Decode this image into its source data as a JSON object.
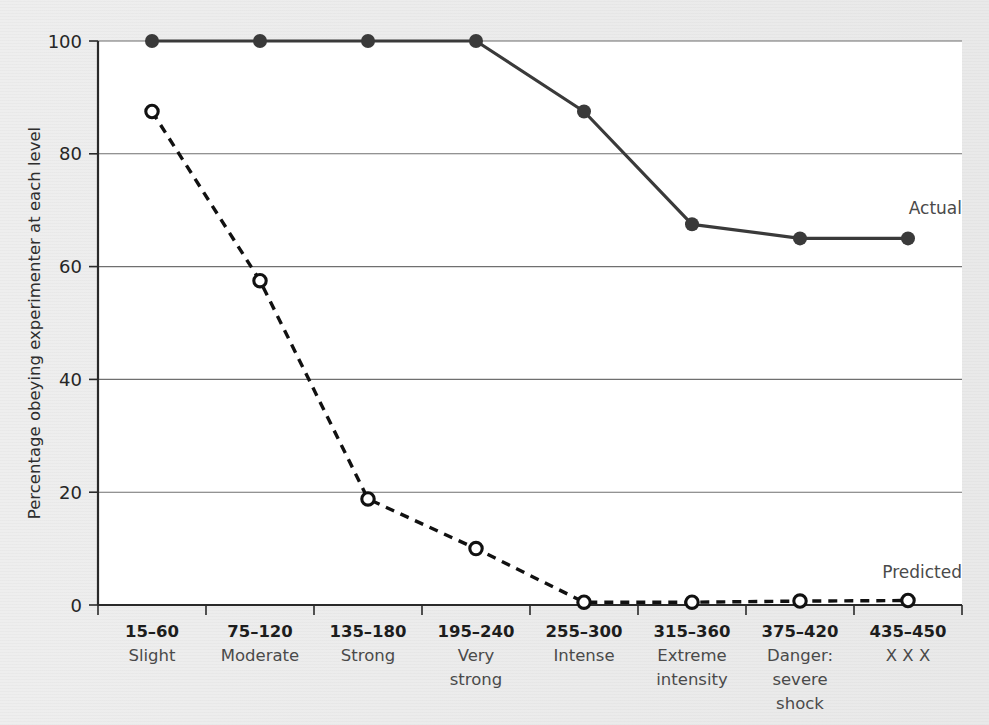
{
  "chart_data": {
    "type": "line",
    "title": "",
    "xlabel": "",
    "ylabel": "Percentage obeying experimenter at each level",
    "ylim": [
      0,
      100
    ],
    "yticks": [
      0,
      20,
      40,
      60,
      80,
      100
    ],
    "grid": "horizontal",
    "legend_position": "inline-right-of-series-end",
    "categories": [
      "15–60",
      "75–120",
      "135–180",
      "195–240",
      "255–300",
      "315–360",
      "375–420",
      "435–450"
    ],
    "category_descriptions": [
      "Slight",
      "Moderate",
      "Strong",
      "Very strong",
      "Intense",
      "Extreme intensity",
      "Danger: severe shock",
      "X X X"
    ],
    "category_descriptions_lines": [
      [
        "Slight"
      ],
      [
        "Moderate"
      ],
      [
        "Strong"
      ],
      [
        "Very",
        "strong"
      ],
      [
        "Intense"
      ],
      [
        "Extreme",
        "intensity"
      ],
      [
        "Danger:",
        "severe",
        "shock"
      ],
      [
        "X X X"
      ]
    ],
    "series": [
      {
        "name": "Actual",
        "marker": "filled-circle",
        "line_style": "solid",
        "color": "#3a3a3a",
        "values": [
          100,
          100,
          100,
          100,
          87.5,
          67.5,
          65,
          65
        ]
      },
      {
        "name": "Predicted",
        "marker": "open-circle",
        "line_style": "dashed",
        "color": "#111111",
        "values": [
          87.5,
          57.5,
          18.8,
          10,
          0.5,
          0.5,
          0.7,
          0.8
        ]
      }
    ],
    "annotations": [
      {
        "text": "Actual",
        "series": "Actual"
      },
      {
        "text": "Predicted",
        "series": "Predicted"
      }
    ]
  },
  "yaxis": {
    "label": "Percentage obeying experimenter at each level",
    "ticks": [
      "0",
      "20",
      "40",
      "60",
      "80",
      "100"
    ]
  },
  "legend": {
    "actual": "Actual",
    "predicted": "Predicted"
  },
  "xaxis": {
    "ranges": [
      "15–60",
      "75–120",
      "135–180",
      "195–240",
      "255–300",
      "315–360",
      "375–420",
      "435–450"
    ],
    "names": [
      "Slight",
      "Moderate",
      "Strong",
      "Very strong",
      "Intense",
      "Extreme intensity",
      "Danger: severe shock",
      "X X X"
    ]
  },
  "colors": {
    "page_background": "#ececec",
    "plot_background": "#ffffff",
    "actual": "#3a3a3a",
    "predicted": "#111111",
    "gridline": "#6f6f6f",
    "axis": "#2a2a2a"
  }
}
